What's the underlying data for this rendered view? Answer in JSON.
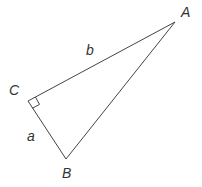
{
  "diagram": {
    "stroke_color": "#444444",
    "vertices": {
      "A": {
        "label": "A",
        "x": 175,
        "y": 22
      },
      "B": {
        "label": "B",
        "x": 66,
        "y": 159
      },
      "C": {
        "label": "C",
        "x": 28,
        "y": 101
      }
    },
    "sides": {
      "b": {
        "label": "b",
        "from": "C",
        "to": "A"
      },
      "a": {
        "label": "a",
        "from": "C",
        "to": "B"
      },
      "c": {
        "label": "",
        "from": "A",
        "to": "B"
      }
    },
    "right_angle_at": "C"
  }
}
